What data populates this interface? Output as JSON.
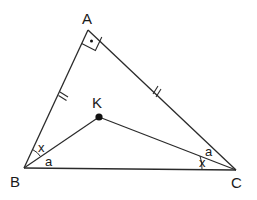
{
  "figure": {
    "type": "geometry-triangle",
    "stroke_color": "#2a2a2a",
    "background": "#ffffff"
  },
  "points": {
    "A": {
      "label": "A",
      "x": 88,
      "y": 30
    },
    "B": {
      "label": "B",
      "x": 24,
      "y": 168
    },
    "C": {
      "label": "C",
      "x": 236,
      "y": 170
    },
    "K": {
      "label": "K",
      "x": 99,
      "y": 117
    }
  },
  "segments": [
    "AB",
    "AC",
    "BC",
    "BK",
    "CK"
  ],
  "marks": {
    "right_angle_at": "A",
    "equal_sides": [
      "AB",
      "AC"
    ],
    "equal_side_tick": "//"
  },
  "angle_labels": {
    "B_upper": "x",
    "B_lower": "a",
    "C_upper": "a",
    "C_lower": "x"
  }
}
